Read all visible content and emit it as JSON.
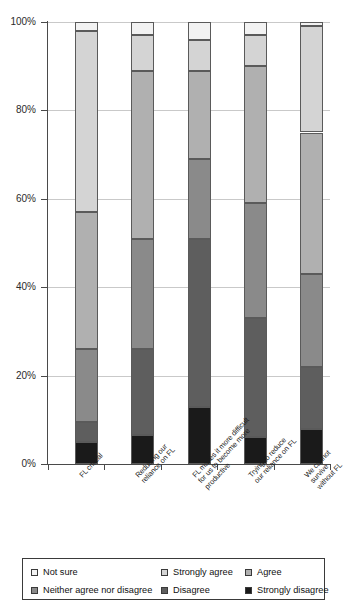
{
  "chart_data": {
    "type": "bar",
    "subtype": "100% stacked bar",
    "title": "",
    "xlabel": "",
    "ylabel": "",
    "ylim": [
      0,
      100
    ],
    "yticks": [
      "0%",
      "20%",
      "40%",
      "60%",
      "80%",
      "100%"
    ],
    "ytick_values": [
      0,
      20,
      40,
      60,
      80,
      100
    ],
    "grid": true,
    "legend_position": "bottom",
    "stack_order_top_to_bottom": [
      "Not sure",
      "Strongly agree",
      "Agree",
      "Neither agree nor  disagree",
      "Disagree",
      "Strongly disagree"
    ],
    "categories": [
      "FL critical",
      "Reducing our\nreliance on FL",
      "FL makes it more difficult\nfor us to become more\nproductive",
      "Trying to reduce\nour reliance on FL",
      "We cannot survive\nwithout FL"
    ],
    "series": [
      {
        "name": "Not sure",
        "color": "#f2f2f2",
        "values": [
          2,
          3,
          4,
          3,
          1
        ]
      },
      {
        "name": "Strongly agree",
        "color": "#d4d4d4",
        "values": [
          41,
          8,
          7,
          7,
          24
        ]
      },
      {
        "name": "Agree",
        "color": "#b0b0b0",
        "values": [
          31,
          38,
          20,
          31,
          32
        ]
      },
      {
        "name": "Neither agree nor  disagree",
        "color": "#8a8a8a",
        "values": [
          16.5,
          25,
          18,
          26,
          21
        ]
      },
      {
        "name": "Disagree",
        "color": "#5e5e5e",
        "values": [
          4.5,
          19.5,
          38,
          27,
          14
        ]
      },
      {
        "name": "Strongly disagree",
        "color": "#1a1a1a",
        "values": [
          5,
          6.5,
          13,
          6,
          8
        ]
      }
    ]
  },
  "legend": {
    "items": [
      {
        "label": "Not sure",
        "color": "#f2f2f2"
      },
      {
        "label": "Strongly agree",
        "color": "#d4d4d4"
      },
      {
        "label": "Agree",
        "color": "#b0b0b0"
      },
      {
        "label": "Neither agree nor  disagree",
        "color": "#8a8a8a"
      },
      {
        "label": "Disagree",
        "color": "#5e5e5e"
      },
      {
        "label": "Strongly disagree",
        "color": "#1a1a1a"
      }
    ]
  },
  "axis": {
    "y_tick_labels": [
      "100%",
      "80%",
      "60%",
      "40%",
      "20%",
      "0%"
    ]
  }
}
